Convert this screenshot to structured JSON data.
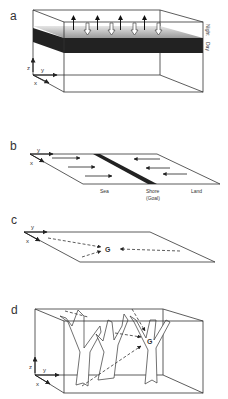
{
  "panels": {
    "a": {
      "label": "a",
      "side_labels": {
        "top": "Night",
        "bottom": "Day"
      },
      "axes": {
        "x": "x",
        "y": "y",
        "z": "z"
      }
    },
    "b": {
      "label": "b",
      "axes": {
        "x": "x",
        "y": "y"
      },
      "zones": {
        "sea": "Sea",
        "shore": "Shore",
        "goal": "(Goal)",
        "land": "Land"
      }
    },
    "c": {
      "label": "c",
      "axes": {
        "x": "x",
        "y": "y"
      },
      "goal": "G"
    },
    "d": {
      "label": "d",
      "axes": {
        "x": "x",
        "y": "y",
        "z": "z"
      },
      "goal": "G"
    }
  },
  "colors": {
    "line": "#333333",
    "dark_band": "#222222",
    "light_band": "#bbbbbb"
  }
}
